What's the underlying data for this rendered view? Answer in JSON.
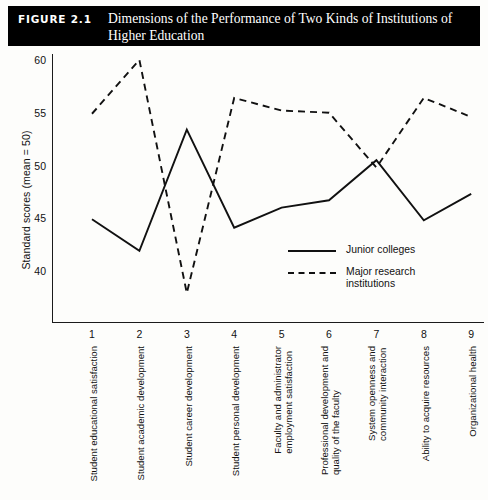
{
  "figure": {
    "number_label": "FIGURE 2.1",
    "title": "Dimensions of the Performance of Two Kinds of Institutions of Higher Education"
  },
  "chart_data": {
    "type": "line",
    "title": "Dimensions of the Performance of Two Kinds of Institutions of Higher Education",
    "xlabel": "",
    "ylabel": "Standard scores (mean = 50)",
    "ylim": [
      36,
      61
    ],
    "yticks": [
      40,
      45,
      50,
      55,
      60
    ],
    "grid": false,
    "legend_position": "center-right",
    "x": [
      1,
      2,
      3,
      4,
      5,
      6,
      7,
      8,
      9
    ],
    "xtick_labels": [
      "1",
      "2",
      "3",
      "4",
      "5",
      "6",
      "7",
      "8",
      "9"
    ],
    "categories": [
      "Student educational satisfaction",
      "Student academic development",
      "Student career development",
      "Student personal development",
      "Faculty and administrator employment satisfaction",
      "Professional development and quality of the faculty",
      "System openness and community interaction",
      "Ability to acquire resources",
      "Organizational health"
    ],
    "category_lines": [
      [
        "Student educational satisfaction"
      ],
      [
        "Student academic development"
      ],
      [
        "Student career development"
      ],
      [
        "Student personal development"
      ],
      [
        "Faculty and administrator",
        "employment satisfaction"
      ],
      [
        "Professional development and",
        "quality of the faculty"
      ],
      [
        "System openness and",
        "community interaction"
      ],
      [
        "Ability to acquire resources"
      ],
      [
        "Organizational health"
      ]
    ],
    "series": [
      {
        "name": "Junior colleges",
        "style": "solid",
        "color": "#111111",
        "values": [
          45.0,
          42.0,
          53.5,
          44.2,
          46.1,
          46.8,
          50.6,
          44.9,
          47.4
        ]
      },
      {
        "name": "Major research institutions",
        "style": "dashed",
        "color": "#111111",
        "values": [
          55.0,
          60.1,
          38.0,
          56.5,
          55.3,
          55.1,
          49.9,
          56.5,
          54.7
        ]
      }
    ]
  },
  "legend": {
    "entries": [
      {
        "label": "Junior colleges",
        "label2": ""
      },
      {
        "label": "Major research",
        "label2": "institutions"
      }
    ]
  }
}
